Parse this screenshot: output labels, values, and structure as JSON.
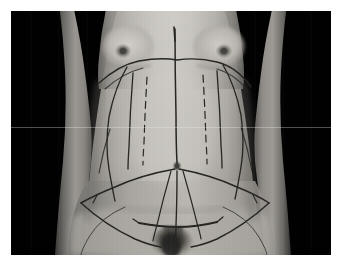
{
  "image": {
    "title": "Preoperative abdominal surgical marking photograph",
    "subject": "Female torso, frontal view, standing",
    "orientation": "portrait-frontal",
    "capture_style": "clinical-photograph",
    "canvas": {
      "width": 346,
      "height": 272
    },
    "photo_area": {
      "x": 11,
      "y": 11,
      "width": 320,
      "height": 244
    },
    "border": {
      "color": "#ffffff",
      "left": 11,
      "top": 11,
      "right": 15,
      "bottom": 17
    },
    "palette": {
      "background": "#000000",
      "page": "#ffffff",
      "skin_light": "#c9c6c0",
      "skin_mid": "#a9a6a1",
      "skin_shadow": "#7e7b77",
      "skin_deep_shadow": "#55534f",
      "marker_ink": "#262421",
      "scanline": "#ebebeb"
    },
    "artifacts": [
      "horizontal light scanline at y=127",
      "vertical scan striping / interlace noise",
      "low contrast grayscale, monochrome"
    ]
  },
  "anatomy": {
    "regions": [
      {
        "name": "chest",
        "label": "Chest / breasts"
      },
      {
        "name": "left-arm",
        "label": "Subject left arm (image right)"
      },
      {
        "name": "right-arm",
        "label": "Subject right arm (image left)"
      },
      {
        "name": "abdomen",
        "label": "Abdomen"
      },
      {
        "name": "umbilicus",
        "label": "Umbilicus (navel)",
        "x": 166,
        "y": 155
      },
      {
        "name": "hips",
        "label": "Hips / iliac crest"
      },
      {
        "name": "pubic-region",
        "label": "Pubic region"
      },
      {
        "name": "thighs",
        "label": "Upper thighs"
      }
    ]
  },
  "markings": {
    "description": "Surgical pen markings for abdominoplasty / liposuction planning",
    "ink_color": "#262421",
    "groups": [
      {
        "id": "upper-arc",
        "label": "Upper costal-margin arc",
        "style": "solid",
        "note": "Wide arc across the upper abdomen below the breasts"
      },
      {
        "id": "midline",
        "label": "Vertical midline",
        "style": "solid",
        "note": "Runs from sternum through umbilicus to pubis"
      },
      {
        "id": "paramedian-dashed",
        "label": "Paramedian dashed lines",
        "style": "dashed",
        "count": 2,
        "note": "Dashed lines flanking the midline"
      },
      {
        "id": "paramedian-solid",
        "label": "Paramedian solid lines",
        "style": "solid",
        "count": 2,
        "note": "Solid vertical lines lateral to the dashed pair"
      },
      {
        "id": "flank-curves",
        "label": "Lateral flank curves",
        "style": "solid",
        "count": 2,
        "note": "Outer curved boundary lines along the flanks"
      },
      {
        "id": "lower-shield",
        "label": "Lower shield / diamond resection outline",
        "style": "solid",
        "note": "Converging lines from umbilicus fanning to the hips and down to the pubic incision"
      },
      {
        "id": "incision-line",
        "label": "Low transverse incision line",
        "style": "solid",
        "note": "Horizontal bikini-line marking above the pubis"
      },
      {
        "id": "thigh-contours",
        "label": "Upper-thigh contour outlines",
        "style": "solid",
        "count": 2
      }
    ]
  }
}
